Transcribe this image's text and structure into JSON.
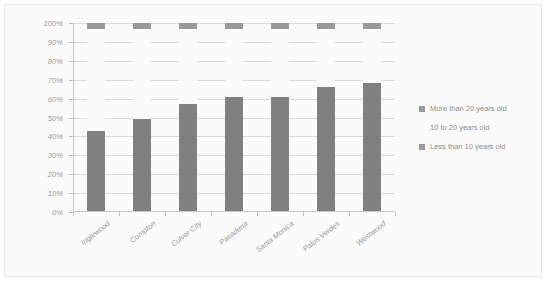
{
  "chart_data": {
    "type": "bar",
    "subtype": "stacked-100",
    "title": "",
    "xlabel": "",
    "ylabel": "",
    "ylim": [
      0,
      100
    ],
    "ytick_labels": [
      "100%",
      "90%",
      "80%",
      "70%",
      "60%",
      "50%",
      "40%",
      "30%",
      "20%",
      "10%",
      "0%"
    ],
    "ytick_values": [
      100,
      90,
      80,
      70,
      60,
      50,
      40,
      30,
      20,
      10,
      0
    ],
    "grid": true,
    "legend_position": "right",
    "categories": [
      "Inglewood",
      "Compton",
      "Culver City",
      "Pasadena",
      "Santa Monica",
      "Palos Verdes",
      "Westwood"
    ],
    "series": [
      {
        "name": "Less than 10 years old",
        "color": "#808080",
        "values": [
          43,
          49,
          57,
          61,
          61,
          66,
          68
        ]
      },
      {
        "name": "10 to 20 years old",
        "color": "#fbfbfb",
        "values": [
          54,
          48,
          40,
          36,
          36,
          31,
          29
        ]
      },
      {
        "name": "More than 20 years old",
        "color": "#9a9a9a",
        "values": [
          3,
          3,
          3,
          3,
          3,
          3,
          3
        ]
      }
    ]
  },
  "legend": {
    "entries": [
      {
        "label": "More than 20 years old",
        "color": "#9a9a9a"
      },
      {
        "label": "10 to 20 years old",
        "color": "#fbfbfb"
      },
      {
        "label": "Less than 10 years old",
        "color": "#9a9a9a"
      }
    ]
  }
}
